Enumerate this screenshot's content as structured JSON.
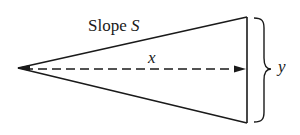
{
  "diagram": {
    "labels": {
      "slope_word": "Slope",
      "slope_symbol": "S",
      "x": "x",
      "y": "y"
    },
    "shape": "isosceles triangle with apex at left, vertical base at right",
    "elements": [
      "upper edge labeled Slope S",
      "lower edge",
      "vertical base edge",
      "dashed altitude arrow from apex to base labeled x",
      "curly brace spanning base labeled y"
    ],
    "colors": {
      "stroke": "#1a1a1a",
      "background": "#ffffff"
    }
  }
}
